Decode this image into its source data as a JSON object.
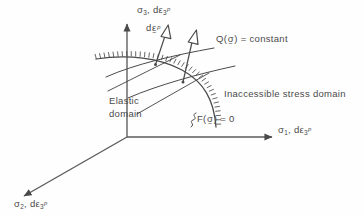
{
  "figure": {
    "background_color": "#fefefe",
    "ink_color": "#4a4a4a",
    "axes": {
      "sigma3": {
        "name": "sigma-3-axis",
        "sigma": "σ",
        "sigma_sub": "3",
        "comma": ", d",
        "eps": "ε",
        "eps_sub": "3",
        "eps_sup": "p",
        "full_text": "σ3, dε3p",
        "direction": "up"
      },
      "sigma1": {
        "name": "sigma-1-axis",
        "sigma": "σ",
        "sigma_sub": "1",
        "comma": ", d",
        "eps": "ε",
        "eps_sub": "3",
        "eps_sup": "p",
        "full_text": "σ1, dε3p",
        "direction": "right"
      },
      "sigma2": {
        "name": "sigma-2-axis",
        "sigma": "σ",
        "sigma_sub": "2",
        "comma": ", d",
        "eps": "ε",
        "eps_sub": "3",
        "eps_sup": "p",
        "full_text": "σ2, dε3p",
        "direction": "down-left"
      }
    },
    "annotations": {
      "strain_increment": {
        "name": "plastic-strain-increment-label",
        "d": "d",
        "eps": "ε",
        "tilde": "~",
        "sup": "p",
        "full_text": "dε~p"
      },
      "potential": {
        "name": "plastic-potential-label",
        "fn": "Q(",
        "arg": "σ",
        "tilde": "~",
        "close": ") = constant",
        "full_text": "Q(σ~) = constant"
      },
      "yield": {
        "name": "yield-function-label",
        "fn": "F(",
        "arg": "σ",
        "tilde": "~",
        "close": ") = 0",
        "full_text": "F(σ~) = 0"
      },
      "inaccessible": {
        "name": "inaccessible-domain-label",
        "text": "Inaccessible stress domain"
      },
      "elastic": {
        "name": "elastic-domain-label",
        "line1": "Elastic",
        "line2": "domain"
      }
    }
  }
}
